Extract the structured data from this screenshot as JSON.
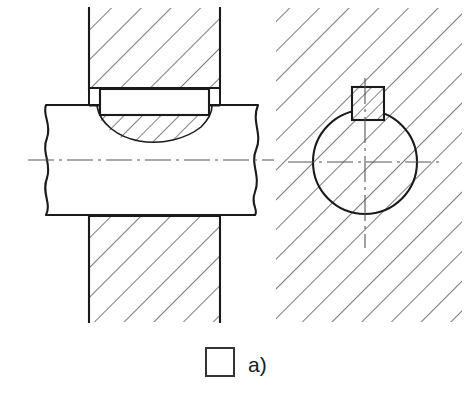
{
  "figure": {
    "title_visible": false,
    "label": "a)",
    "legend": {
      "swatch_name": "square-swatch",
      "swatch_fill": "#ffffff",
      "swatch_stroke": "#333333",
      "caption": "a)"
    },
    "colors": {
      "outline": "#1a1a1a",
      "hatch": "#333333",
      "centerline": "#555555",
      "background": "#ffffff",
      "part_fill": "#ffffff"
    },
    "line_weights": {
      "outline_px": 2.1,
      "hatch_px": 1.1,
      "centerline_px": 1.0
    },
    "views": [
      {
        "id": "longitudinal-section",
        "name": "Longitudinal section through shaft, hub and key",
        "position": "left",
        "parts": [
          {
            "name": "hub-upper",
            "type": "hub",
            "hatched": true,
            "hatch_angle_deg": 45,
            "hatch_spacing_px": 21,
            "bounds": {
              "x": 89,
              "y": 8,
              "width": 131,
              "height": 80
            }
          },
          {
            "name": "hub-lower",
            "type": "hub",
            "hatched": true,
            "hatch_angle_deg": 45,
            "hatch_spacing_px": 21,
            "bounds": {
              "x": 89,
              "y": 215,
              "width": 131,
              "height": 107
            }
          },
          {
            "name": "shaft",
            "type": "shaft",
            "hatched": false,
            "broken_ends": true,
            "bounds": {
              "x": 40,
              "y": 105,
              "width": 218,
              "height": 110
            }
          },
          {
            "name": "keyway-seat",
            "type": "keyway",
            "hatched": true,
            "hatch_angle_deg": 45,
            "hatch_spacing_px": 14,
            "description": "hatched lenticular keyway pocket machined in shaft"
          },
          {
            "name": "key",
            "type": "key",
            "hatched": false,
            "fill": "#ffffff",
            "bounds": {
              "x": 100,
              "y": 89,
              "width": 109,
              "height": 26
            }
          }
        ],
        "centerline": {
          "y": 160,
          "x1": 28,
          "x2": 274,
          "style": "dash-dot"
        }
      },
      {
        "id": "cross-section",
        "name": "Cross section through shaft, hub and key",
        "position": "right",
        "parts": [
          {
            "name": "hub-surround",
            "type": "hub",
            "hatched": true,
            "hatch_angle_deg": 45,
            "hatch_spacing_px": 21,
            "bounds": {
              "x": 276,
              "y": 8,
              "width": 186,
              "height": 314
            }
          },
          {
            "name": "shaft-circle",
            "type": "shaft",
            "hatched": true,
            "hatch_angle_deg": 45,
            "hatch_spacing_px": 21,
            "center": {
              "x": 365,
              "y": 162
            },
            "radius": 52
          },
          {
            "name": "key-square",
            "type": "key",
            "hatched": true,
            "hatch_angle_deg": 45,
            "hatch_spacing_px": 9,
            "bounds": {
              "x": 352,
              "y": 87,
              "width": 32,
              "height": 33
            }
          }
        ],
        "centerlines": {
          "horizontal": {
            "y": 162,
            "x1": 288,
            "x2": 442,
            "style": "dash-dot"
          },
          "vertical": {
            "x": 365,
            "y1": 78,
            "y2": 248,
            "style": "dash-dot"
          }
        }
      }
    ]
  }
}
